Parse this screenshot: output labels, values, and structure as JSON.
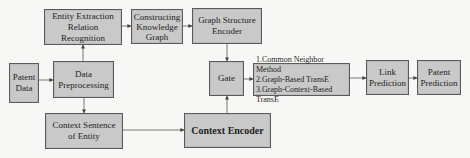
{
  "diagram": {
    "type": "flowchart",
    "colors": {
      "box_fill": "#c9c9c9",
      "box_border": "#5a5a5a",
      "arrow": "#444444",
      "background": "#f7f7f5"
    },
    "nodes": {
      "patent_data": {
        "label": "Patent\nData"
      },
      "data_preprocessing": {
        "label": "Data\nPreprocessing"
      },
      "entity_extraction": {
        "label": "Entity Extraction\nRelation Recognition"
      },
      "constructing_kg": {
        "label": "Constructing\nKnowledge\nGraph"
      },
      "graph_structure_encoder": {
        "label": "Graph Structure\nEncoder"
      },
      "context_sentence": {
        "label": "Context Sentence\nof Entity"
      },
      "context_encoder": {
        "label": "Context Encoder"
      },
      "gate": {
        "label": "Gate"
      },
      "methods": {
        "label": "1.Common Neighbor Method\n2.Graph-Based TransE\n3.Graph-Context-Based TransE"
      },
      "link_prediction": {
        "label": "Link\nPrediction"
      },
      "patent_prediction": {
        "label": "Patent\nPrediction"
      }
    },
    "edges": [
      {
        "from": "patent_data",
        "to": "data_preprocessing"
      },
      {
        "from": "data_preprocessing",
        "to": "entity_extraction"
      },
      {
        "from": "data_preprocessing",
        "to": "context_sentence"
      },
      {
        "from": "entity_extraction",
        "to": "constructing_kg"
      },
      {
        "from": "constructing_kg",
        "to": "graph_structure_encoder"
      },
      {
        "from": "graph_structure_encoder",
        "to": "gate"
      },
      {
        "from": "context_sentence",
        "to": "context_encoder"
      },
      {
        "from": "context_encoder",
        "to": "gate"
      },
      {
        "from": "gate",
        "to": "methods"
      },
      {
        "from": "methods",
        "to": "link_prediction"
      },
      {
        "from": "link_prediction",
        "to": "patent_prediction"
      }
    ]
  }
}
